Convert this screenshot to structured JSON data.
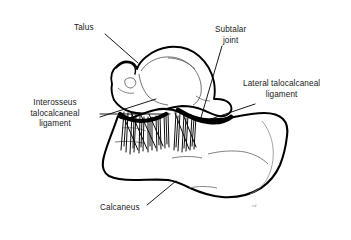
{
  "figure": {
    "background_color": "#ffffff",
    "ink_color": "#000000",
    "detail_line_color": "#4a4a4a",
    "signature_color": "#8d8d8d",
    "signature_text": "rd"
  },
  "labels": [
    {
      "id": "talus",
      "text": "Talus",
      "align": "center",
      "leader": {
        "from_x": 105,
        "from_y": 34,
        "to_x": 138,
        "to_y": 63
      }
    },
    {
      "id": "subtalar-joint",
      "text": "Subtalar\njoint",
      "align": "center",
      "leader": {
        "from_x": 222,
        "from_y": 46,
        "to_x": 200,
        "to_y": 121
      }
    },
    {
      "id": "lateral-talocalcaneal-ligament",
      "text": "Lateral talocalcaneal\nligament",
      "align": "center",
      "leader": {
        "from_x": 255,
        "from_y": 104,
        "to_x": 205,
        "to_y": 121
      }
    },
    {
      "id": "interosseus-talocalcaneal-ligament",
      "text": "Interosseus\ntalocalcaneal\nligament",
      "align": "center",
      "leader_a": {
        "from_x": 100,
        "from_y": 114,
        "to_x": 168,
        "to_y": 114
      },
      "leader_b": {
        "from_x": 100,
        "from_y": 118,
        "to_x": 155,
        "to_y": 100
      }
    },
    {
      "id": "calcaneus",
      "text": "Calcaneus",
      "align": "center",
      "leader": {
        "from_x": 147,
        "from_y": 205,
        "to_x": 176,
        "to_y": 181
      }
    }
  ],
  "structures": [
    {
      "id": "talus-bone",
      "name": "Talus",
      "kind": "bone-outline"
    },
    {
      "id": "calcaneus-bone",
      "name": "Calcaneus",
      "kind": "bone-outline"
    },
    {
      "id": "interosseous-ligament-fibers",
      "name": "Interosseus talocalcaneal ligament",
      "kind": "fiber-bundle"
    },
    {
      "id": "lateral-ligament-band",
      "name": "Lateral talocalcaneal ligament",
      "kind": "thick-band"
    },
    {
      "id": "subtalar-joint-line",
      "name": "Subtalar joint",
      "kind": "joint-space"
    }
  ]
}
